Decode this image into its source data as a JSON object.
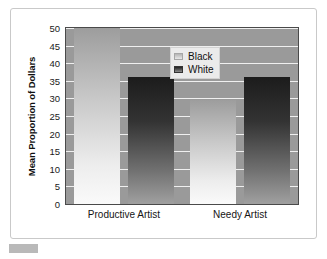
{
  "chart_data": {
    "type": "bar",
    "title": "",
    "subtitle": "",
    "xlabel": "",
    "ylabel": "Mean Proportion of Dollars",
    "categories": [
      "Productive Artist",
      "Needy Artist"
    ],
    "series": [
      {
        "name": "Black",
        "values": [
          50,
          29.5
        ],
        "color": "#d8d8d8"
      },
      {
        "name": "White",
        "values": [
          36,
          36
        ],
        "color": "#3a3a3a"
      }
    ],
    "ylim": [
      0,
      50
    ],
    "ytick_values": [
      0,
      5,
      10,
      15,
      20,
      25,
      30,
      35,
      40,
      45,
      50
    ],
    "ytick_labels": [
      "0",
      "5",
      "10",
      "15",
      "20",
      "25",
      "30",
      "35",
      "40",
      "45",
      "50"
    ],
    "grid": true,
    "grid_color": "#efefef",
    "legend_position": "upper center",
    "plot_background": "#9a9a9a",
    "frame_color": "#c9c9c9"
  },
  "legend": {
    "items": [
      {
        "label": "Black"
      },
      {
        "label": "White"
      }
    ]
  }
}
